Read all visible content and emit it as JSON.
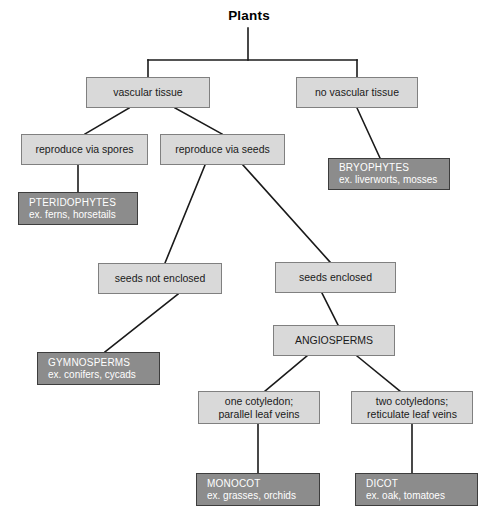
{
  "diagram": {
    "title": "Plants",
    "style": {
      "light_fill": "#d9d9d9",
      "light_border": "#808080",
      "dark_fill": "#8c8c8c",
      "dark_border": "#3d3d3d",
      "dark_text": "#ffffff",
      "light_text": "#1a1a1a",
      "connector": "#1a1a1a",
      "background": "#ffffff"
    },
    "nodes": [
      {
        "id": "vascular_tissue",
        "line1": "vascular tissue",
        "line2": "",
        "kind": "light"
      },
      {
        "id": "no_vascular",
        "line1": "no vascular tissue",
        "line2": "",
        "kind": "light"
      },
      {
        "id": "spores",
        "line1": "reproduce via spores",
        "line2": "",
        "kind": "light"
      },
      {
        "id": "seeds",
        "line1": "reproduce via seeds",
        "line2": "",
        "kind": "light"
      },
      {
        "id": "bryophytes",
        "line1": "BRYOPHYTES",
        "line2": "ex. liverworts, mosses",
        "kind": "dark"
      },
      {
        "id": "pteridophytes",
        "line1": "PTERIDOPHYTES",
        "line2": "ex. ferns, horsetails",
        "kind": "dark"
      },
      {
        "id": "seeds_not_enclosed",
        "line1": "seeds not enclosed",
        "line2": "",
        "kind": "light"
      },
      {
        "id": "seeds_enclosed",
        "line1": "seeds enclosed",
        "line2": "",
        "kind": "light"
      },
      {
        "id": "gymnosperms",
        "line1": "GYMNOSPERMS",
        "line2": "ex. conifers, cycads",
        "kind": "dark"
      },
      {
        "id": "angiosperms",
        "line1": "ANGIOSPERMS",
        "line2": "",
        "kind": "light"
      },
      {
        "id": "one_cotyledon",
        "line1": "one cotyledon;",
        "line2": "parallel leaf veins",
        "kind": "light"
      },
      {
        "id": "two_cotyledons",
        "line1": "two cotyledons;",
        "line2": "reticulate leaf veins",
        "kind": "light"
      },
      {
        "id": "monocot",
        "line1": "MONOCOT",
        "line2": "ex. grasses, orchids",
        "kind": "dark"
      },
      {
        "id": "dicot",
        "line1": "DICOT",
        "line2": "ex. oak, tomatoes",
        "kind": "dark"
      }
    ]
  }
}
